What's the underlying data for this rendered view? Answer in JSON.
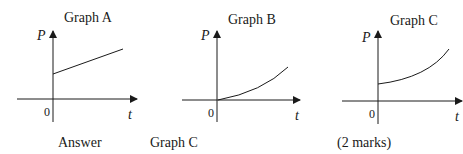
{
  "graphs": [
    {
      "title": "Graph A",
      "y_label": "P",
      "x_label": "t",
      "origin_label": "0",
      "shape": "straight line with positive intercept"
    },
    {
      "title": "Graph B",
      "y_label": "P",
      "x_label": "t",
      "origin_label": "0",
      "shape": "increasing curve from origin"
    },
    {
      "title": "Graph C",
      "y_label": "P",
      "x_label": "t",
      "origin_label": "0",
      "shape": "increasing curve with positive intercept"
    }
  ],
  "answer": {
    "label": "Answer",
    "value": "Graph C",
    "marks": "(2 marks)"
  },
  "colors": {
    "ink": "#1a1a1a",
    "background": "#ffffff"
  }
}
